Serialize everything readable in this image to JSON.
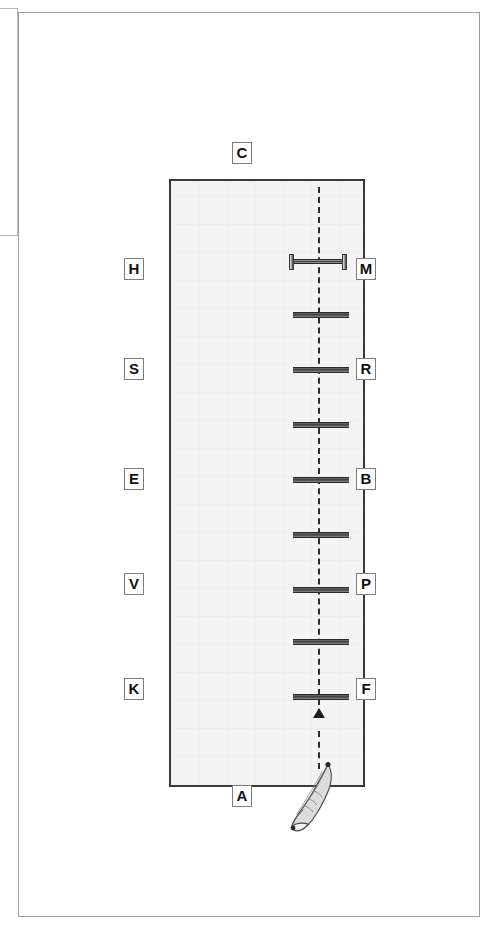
{
  "page": {
    "background_color": "#ffffff",
    "frame_border_color": "#9e9e9e"
  },
  "left_stub": {
    "name": "clipped-adjacent-panel",
    "border_color": "#b9b9b9"
  },
  "field": {
    "name": "drill-field",
    "fill_color": "#f4f4f4",
    "border_color": "#3a3a3a"
  },
  "centre_line": {
    "style": "dashed",
    "color": "#2c2c2c"
  },
  "arrow": {
    "name": "travel-direction-arrow",
    "direction": "up",
    "color": "#1d1d1d"
  },
  "foot": {
    "name": "foot-illustration",
    "outline_color": "#4a4a4a",
    "fill_color": "#dedede"
  },
  "labels": {
    "top": {
      "text": "C",
      "side": "top"
    },
    "bottom": {
      "text": "A",
      "side": "bottom"
    },
    "left": [
      {
        "text": "H"
      },
      {
        "text": "S"
      },
      {
        "text": "E"
      },
      {
        "text": "V"
      },
      {
        "text": "K"
      }
    ],
    "right": [
      {
        "text": "M"
      },
      {
        "text": "R"
      },
      {
        "text": "B"
      },
      {
        "text": "P"
      },
      {
        "text": "F"
      }
    ]
  },
  "rungs": [
    {
      "index": 1,
      "capped": true
    },
    {
      "index": 2,
      "capped": false
    },
    {
      "index": 3,
      "capped": false
    },
    {
      "index": 4,
      "capped": false
    },
    {
      "index": 5,
      "capped": false
    },
    {
      "index": 6,
      "capped": false
    },
    {
      "index": 7,
      "capped": false
    },
    {
      "index": 8,
      "capped": false
    },
    {
      "index": 9,
      "capped": false
    }
  ]
}
